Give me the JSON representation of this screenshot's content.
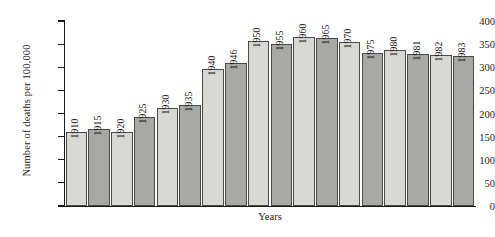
{
  "chart_data": {
    "type": "bar",
    "title": "",
    "xlabel": "Years",
    "ylabel": "Number of  deaths per 100,000",
    "ylim": [
      0,
      400
    ],
    "yticks": [
      0,
      50,
      100,
      150,
      200,
      250,
      300,
      350,
      400
    ],
    "grid": false,
    "legend": "none",
    "categories": [
      "1910",
      "1915",
      "1920",
      "1925",
      "1930",
      "1935",
      "1940",
      "1946",
      "1950",
      "1955",
      "1960",
      "1965",
      "1970",
      "1975",
      "1980",
      "1981",
      "1982",
      "1983"
    ],
    "values": [
      160,
      166,
      160,
      192,
      211,
      218,
      296,
      310,
      356,
      350,
      366,
      364,
      354,
      330,
      337,
      329,
      327,
      324
    ],
    "bar_colors": [
      "#d8d8d4",
      "#a8a8a4",
      "#d8d8d4",
      "#a8a8a4",
      "#d8d8d4",
      "#a8a8a4",
      "#d8d8d4",
      "#a8a8a4",
      "#d8d8d4",
      "#a8a8a4",
      "#d8d8d4",
      "#a8a8a4",
      "#d8d8d4",
      "#a8a8a4",
      "#d8d8d4",
      "#a8a8a4",
      "#d8d8d4",
      "#a8a8a4"
    ],
    "bar_outline_color": "#4a4a4a",
    "axis_color": "#1a1a1a",
    "background": "#ffffff"
  }
}
